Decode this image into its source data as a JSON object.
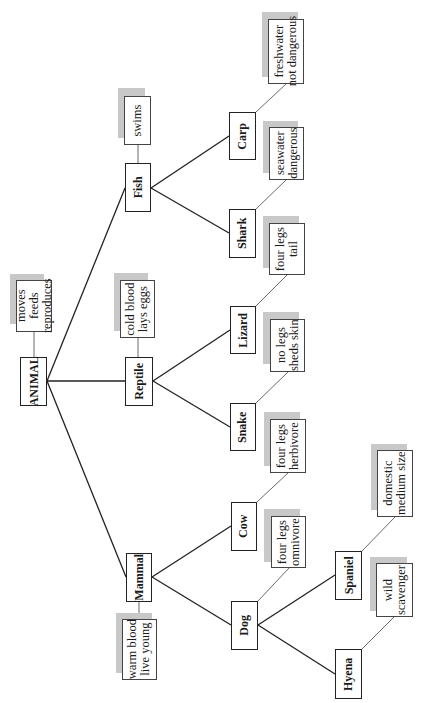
{
  "diagram": {
    "type": "tree",
    "orientation": "rotated-90-ccw",
    "colors": {
      "line": "#222222",
      "shadow": "#c8c8c8",
      "box": "#ffffff"
    },
    "root": {
      "label": "ANIMAL",
      "attributes": [
        "moves",
        "feeds",
        "reproduces"
      ]
    },
    "classes": {
      "mammal": {
        "label": "Mammal",
        "attributes": [
          "warm blood",
          "live young"
        ]
      },
      "reptile": {
        "label": "Reptile",
        "attributes": [
          "cold blood",
          "lays eggs"
        ]
      },
      "fish": {
        "label": "Fish",
        "attributes": [
          "swims"
        ]
      }
    },
    "species": {
      "dog": {
        "label": "Dog",
        "attributes": [
          "four legs",
          "omnivore"
        ]
      },
      "cow": {
        "label": "Cow",
        "attributes": [
          "four legs",
          "herbivore"
        ]
      },
      "snake": {
        "label": "Snake",
        "attributes": [
          "no legs",
          "sheds skin"
        ]
      },
      "lizard": {
        "label": "Lizard",
        "attributes": [
          "four legs",
          "tail"
        ]
      },
      "shark": {
        "label": "Shark",
        "attributes": [
          "seawater",
          "dangerous"
        ]
      },
      "carp": {
        "label": "Carp",
        "attributes": [
          "freshwater",
          "not dangerous"
        ]
      }
    },
    "breeds": {
      "hyena": {
        "label": "Hyena",
        "attributes": [
          "wild",
          "scavenger"
        ]
      },
      "spaniel": {
        "label": "Spaniel",
        "attributes": [
          "domestic",
          "medium size"
        ]
      }
    }
  }
}
